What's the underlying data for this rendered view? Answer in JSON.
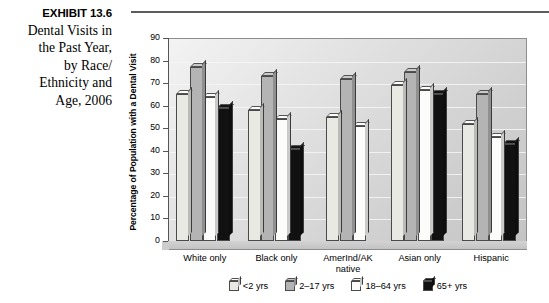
{
  "caption": {
    "exhibit_number": "EXHIBIT 13.6",
    "lines": [
      "Dental Visits in",
      "the Past Year,",
      "by Race/",
      "Ethnicity and",
      "Age, 2006"
    ]
  },
  "chart_data": {
    "type": "bar",
    "xlabel": "",
    "ylabel": "Percentage of  Population with a Dental Visit",
    "ylim": [
      0,
      90
    ],
    "yticks": [
      0,
      10,
      20,
      30,
      40,
      50,
      60,
      70,
      80,
      90
    ],
    "grid": true,
    "legend_position": "bottom",
    "categories": [
      "White only",
      "Black only",
      "AmerInd/AK native",
      "Asian only",
      "Hispanic"
    ],
    "series": [
      {
        "name": "<2 yrs",
        "color": "#e9e9e4",
        "values": [
          65,
          58,
          55,
          69,
          52
        ]
      },
      {
        "name": "2–17 yrs",
        "color": "#b4b4b4",
        "values": [
          77,
          73,
          72,
          75,
          65
        ]
      },
      {
        "name": "18–64 yrs",
        "color": "#fcfcfa",
        "values": [
          64,
          54,
          51,
          67,
          46
        ]
      },
      {
        "name": "65+ yrs",
        "color": "#111111",
        "values": [
          59,
          41,
          null,
          65,
          43
        ]
      }
    ]
  }
}
